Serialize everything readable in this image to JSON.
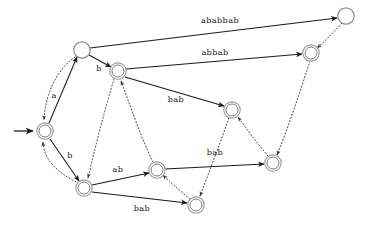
{
  "diagram": {
    "kind": "state-transition-diagram",
    "canvas": {
      "width": 367,
      "height": 225,
      "background": "#ffffff"
    },
    "colors": {
      "solid_edge": "#1b1b1b",
      "dotted_edge": "#3a3a3a",
      "node_stroke": "#8c8c8c",
      "node_fill": "#ffffff",
      "label_text": "#1a1a1a"
    },
    "start_marker": {
      "name": "start-arrow",
      "from_x": 14,
      "from_y": 131,
      "to_x": 34,
      "to_y": 131
    },
    "nodes": [
      {
        "id": "q_start",
        "label": "",
        "x": 45,
        "y": 131,
        "r": 8.2,
        "double": true,
        "name": "state-start"
      },
      {
        "id": "q_tl",
        "label": "",
        "x": 82,
        "y": 50,
        "r": 8.2,
        "double": false,
        "name": "state-top-left"
      },
      {
        "id": "q_b",
        "label": "",
        "x": 118,
        "y": 71,
        "r": 8.2,
        "double": true,
        "name": "state-b"
      },
      {
        "id": "q_tr",
        "label": "",
        "x": 346,
        "y": 16,
        "r": 8.2,
        "double": false,
        "name": "state-top-right"
      },
      {
        "id": "q_r",
        "label": "",
        "x": 311,
        "y": 53,
        "r": 8.2,
        "double": true,
        "name": "state-right"
      },
      {
        "id": "q_mr",
        "label": "",
        "x": 232,
        "y": 110,
        "r": 8.2,
        "double": true,
        "name": "state-mid-right"
      },
      {
        "id": "q_bl",
        "label": "",
        "x": 84,
        "y": 188,
        "r": 8.2,
        "double": true,
        "name": "state-bottom-left"
      },
      {
        "id": "q_bm",
        "label": "",
        "x": 157,
        "y": 170,
        "r": 8.2,
        "double": true,
        "name": "state-bottom-middle"
      },
      {
        "id": "q_br",
        "label": "",
        "x": 273,
        "y": 163,
        "r": 8.2,
        "double": true,
        "name": "state-bottom-right"
      },
      {
        "id": "q_bot",
        "label": "",
        "x": 196,
        "y": 205,
        "r": 8.2,
        "double": true,
        "name": "state-bottom"
      }
    ],
    "edges_solid": [
      {
        "id": "e_start_tl",
        "from": "q_start",
        "to": "q_tl",
        "label": "a",
        "label_x": 54,
        "label_y": 96,
        "name": "edge-a"
      },
      {
        "id": "e_start_bl",
        "from": "q_start",
        "to": "q_bl",
        "label": "b",
        "label_x": 70,
        "label_y": 156,
        "name": "edge-b-lower"
      },
      {
        "id": "e_tl_b",
        "from": "q_tl",
        "to": "q_b",
        "label": "b",
        "label_x": 99,
        "label_y": 69,
        "name": "edge-b-upper"
      },
      {
        "id": "e_tl_tr",
        "from": "q_tl",
        "to": "q_tr",
        "label": "ababbab",
        "label_x": 220,
        "label_y": 21,
        "name": "edge-ababbab"
      },
      {
        "id": "e_b_r",
        "from": "q_b",
        "to": "q_r",
        "label": "abbab",
        "label_x": 215,
        "label_y": 53,
        "name": "edge-abbab"
      },
      {
        "id": "e_b_mr",
        "from": "q_b",
        "to": "q_mr",
        "label": "bab",
        "label_x": 176,
        "label_y": 100,
        "name": "edge-bab-upper"
      },
      {
        "id": "e_bl_bm",
        "from": "q_bl",
        "to": "q_bm",
        "label": "ab",
        "label_x": 118,
        "label_y": 170,
        "name": "edge-ab"
      },
      {
        "id": "e_bm_br",
        "from": "q_bm",
        "to": "q_br",
        "label": "bab",
        "label_x": 215,
        "label_y": 153,
        "name": "edge-bab-middle"
      },
      {
        "id": "e_bl_bot",
        "from": "q_bl",
        "to": "q_bot",
        "label": "bab",
        "label_x": 142,
        "label_y": 209,
        "name": "edge-bab-lower"
      }
    ],
    "edges_dotted": [
      {
        "id": "f_tl_start",
        "from": "q_tl",
        "to": "q_start",
        "name": "fail-link-top-left-to-start"
      },
      {
        "id": "f_bl_start",
        "from": "q_bl",
        "to": "q_start",
        "name": "fail-link-bottom-left-to-start"
      },
      {
        "id": "f_b_bl",
        "from": "q_b",
        "to": "q_bl",
        "name": "fail-link-b-to-bottom-left"
      },
      {
        "id": "f_bm_b",
        "from": "q_bm",
        "to": "q_b",
        "name": "fail-link-bottom-middle-to-b"
      },
      {
        "id": "f_bot_bm",
        "from": "q_bot",
        "to": "q_bm",
        "name": "fail-link-bottom-to-bottom-middle"
      },
      {
        "id": "f_mr_bot",
        "from": "q_mr",
        "to": "q_bot",
        "name": "fail-link-mid-right-to-bottom"
      },
      {
        "id": "f_br_mr",
        "from": "q_br",
        "to": "q_mr",
        "name": "fail-link-bottom-right-to-mid-right"
      },
      {
        "id": "f_r_br",
        "from": "q_r",
        "to": "q_br",
        "name": "fail-link-right-to-bottom-right"
      },
      {
        "id": "f_tr_r",
        "from": "q_tr",
        "to": "q_r",
        "name": "fail-link-top-right-to-right"
      }
    ],
    "labels": {
      "a": "a",
      "b_upper": "b",
      "b_lower": "b",
      "ab": "ab",
      "bab_upper": "bab",
      "bab_middle": "bab",
      "bab_lower": "bab",
      "abbab": "abbab",
      "ababbab": "ababbab"
    }
  }
}
